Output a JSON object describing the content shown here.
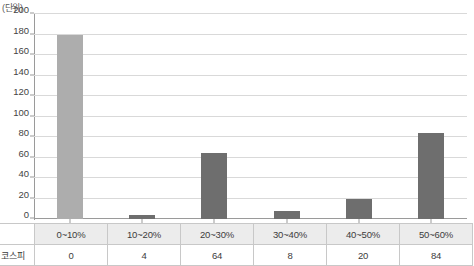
{
  "chart_data": {
    "type": "bar",
    "title": "",
    "unit_label": "(단위)",
    "xlabel": "",
    "ylabel": "",
    "ylim": [
      0,
      200
    ],
    "ytick_step": 20,
    "yticks": [
      200,
      180,
      160,
      140,
      120,
      100,
      80,
      60,
      40,
      20,
      0
    ],
    "grid": true,
    "legend": false,
    "categories": [
      "0~10%",
      "10~20%",
      "20~30%",
      "30~40%",
      "40~50%",
      "50~60%"
    ],
    "series": [
      {
        "name": "코스피",
        "values": [
          0,
          4,
          64,
          8,
          20,
          84
        ]
      }
    ],
    "bar_display_heights": [
      180,
      4,
      64,
      8,
      20,
      84
    ],
    "bar_colors": [
      "#adadad",
      "#6e6e6e",
      "#6e6e6e",
      "#6e6e6e",
      "#6e6e6e",
      "#6e6e6e"
    ]
  },
  "table": {
    "corner_label": "",
    "row_label": "코스피",
    "headers": [
      "0~10%",
      "10~20%",
      "20~30%",
      "30~40%",
      "40~50%",
      "50~60%"
    ],
    "values": [
      "0",
      "4",
      "64",
      "8",
      "20",
      "84"
    ]
  },
  "colors": {
    "bar_light": "#adadad",
    "bar_dark": "#6e6e6e",
    "gridline": "#d9d9d9",
    "axis": "#9a9a9a",
    "header_bg": "#ececec",
    "border": "#c8c8c8"
  }
}
